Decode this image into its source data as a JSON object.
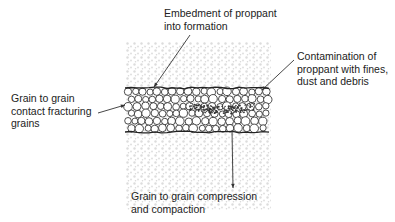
{
  "diagram": {
    "colors": {
      "formation_speckle": "#d6d6d6",
      "grain_fill": "#ffffff",
      "grain_stroke": "#222222",
      "fines": "#333333",
      "leader_line": "#333333",
      "text": "#222222"
    },
    "regions": {
      "formation": {
        "x": 125,
        "y": 42,
        "width": 146,
        "height": 168
      },
      "proppant_pack": {
        "x": 125,
        "y": 88,
        "width": 146,
        "height": 44
      }
    },
    "labels": [
      {
        "id": "embedment",
        "lines": [
          "Embedment of proppant",
          "into formation"
        ],
        "x": 164,
        "y": 7
      },
      {
        "id": "contamination",
        "lines": [
          "Contamination of",
          "proppant with fines,",
          "dust and debris"
        ],
        "x": 297,
        "y": 50
      },
      {
        "id": "grain-contact",
        "lines": [
          "Grain to grain",
          "contact fracturing",
          "grains"
        ],
        "x": 11,
        "y": 92
      },
      {
        "id": "compression",
        "lines": [
          "Grain to grain compression",
          "and compaction"
        ],
        "x": 131,
        "y": 190
      }
    ],
    "leaders": [
      {
        "id": "embedment",
        "x1": 190,
        "y1": 35,
        "x2": 154,
        "y2": 87
      },
      {
        "id": "contamination",
        "x1": 294,
        "y1": 60,
        "x2": 262,
        "y2": 90
      },
      {
        "id": "grain-contact",
        "x1": 98,
        "y1": 113,
        "x2": 125,
        "y2": 105
      },
      {
        "id": "compression",
        "x1": 232,
        "y1": 130,
        "x2": 233,
        "y2": 188
      }
    ]
  }
}
